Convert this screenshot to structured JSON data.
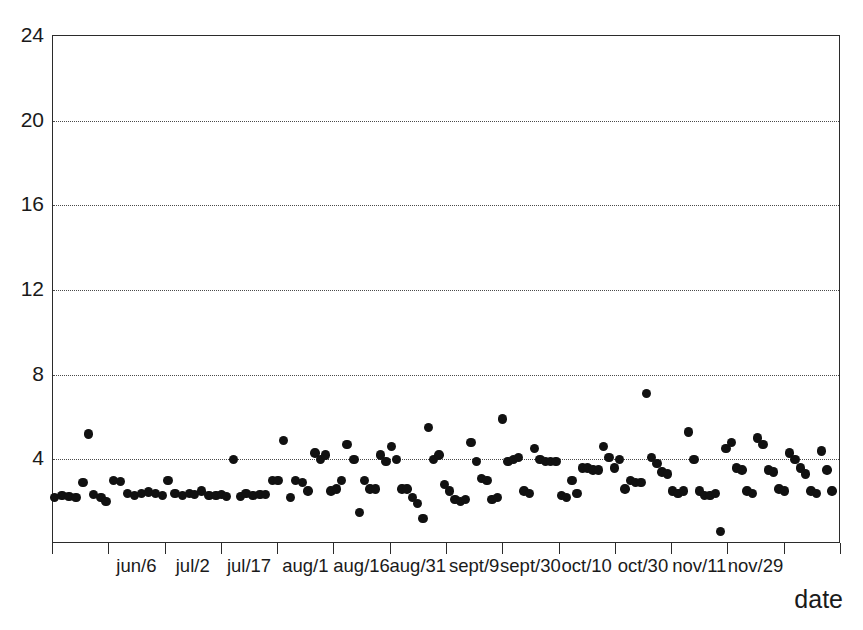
{
  "chart_data": {
    "type": "scatter",
    "title": "",
    "xlabel": "date",
    "ylabel": "",
    "ylim": [
      0,
      24
    ],
    "yticks": [
      4,
      8,
      12,
      16,
      20,
      24
    ],
    "ytick_labels": [
      "4",
      "8",
      "12",
      "16",
      "20",
      "24"
    ],
    "grid": "horizontal-dotted",
    "legend": "none",
    "xtick_labels": [
      "jun/6",
      "jul/2",
      "jul/17",
      "aug/1",
      "aug/16",
      "aug/31",
      "sept/9",
      "sept/30",
      "oct/10",
      "oct/30",
      "nov/11",
      "nov/29"
    ],
    "xtick_count": 14,
    "marker": {
      "shape": "circle",
      "color": "#111111",
      "size": 9
    },
    "points": [
      {
        "x": 2,
        "y": 2.2
      },
      {
        "x": 10,
        "y": 2.3
      },
      {
        "x": 18,
        "y": 2.25
      },
      {
        "x": 26,
        "y": 2.2
      },
      {
        "x": 34,
        "y": 2.9
      },
      {
        "x": 40,
        "y": 5.2
      },
      {
        "x": 46,
        "y": 2.35
      },
      {
        "x": 54,
        "y": 2.2
      },
      {
        "x": 60,
        "y": 2.0
      },
      {
        "x": 68,
        "y": 3.0
      },
      {
        "x": 76,
        "y": 2.95
      },
      {
        "x": 84,
        "y": 2.4
      },
      {
        "x": 92,
        "y": 2.3
      },
      {
        "x": 100,
        "y": 2.4
      },
      {
        "x": 108,
        "y": 2.45
      },
      {
        "x": 116,
        "y": 2.4
      },
      {
        "x": 124,
        "y": 2.3
      },
      {
        "x": 130,
        "y": 3.0
      },
      {
        "x": 138,
        "y": 2.4
      },
      {
        "x": 146,
        "y": 2.3
      },
      {
        "x": 154,
        "y": 2.4
      },
      {
        "x": 160,
        "y": 2.35
      },
      {
        "x": 168,
        "y": 2.5
      },
      {
        "x": 176,
        "y": 2.3
      },
      {
        "x": 184,
        "y": 2.3
      },
      {
        "x": 190,
        "y": 2.35
      },
      {
        "x": 196,
        "y": 2.25
      },
      {
        "x": 204,
        "y": 4.0
      },
      {
        "x": 212,
        "y": 2.25
      },
      {
        "x": 218,
        "y": 2.4
      },
      {
        "x": 226,
        "y": 2.3
      },
      {
        "x": 234,
        "y": 2.35
      },
      {
        "x": 240,
        "y": 2.35
      },
      {
        "x": 248,
        "y": 3.0
      },
      {
        "x": 254,
        "y": 3.0
      },
      {
        "x": 260,
        "y": 4.9
      },
      {
        "x": 268,
        "y": 2.2
      },
      {
        "x": 274,
        "y": 3.0
      },
      {
        "x": 282,
        "y": 2.9
      },
      {
        "x": 288,
        "y": 2.5
      },
      {
        "x": 296,
        "y": 4.3
      },
      {
        "x": 302,
        "y": 4.0
      },
      {
        "x": 308,
        "y": 4.2
      },
      {
        "x": 314,
        "y": 2.5
      },
      {
        "x": 320,
        "y": 2.6
      },
      {
        "x": 326,
        "y": 3.0
      },
      {
        "x": 332,
        "y": 4.7
      },
      {
        "x": 340,
        "y": 4.0
      },
      {
        "x": 346,
        "y": 1.5
      },
      {
        "x": 352,
        "y": 3.0
      },
      {
        "x": 358,
        "y": 2.6
      },
      {
        "x": 364,
        "y": 2.6
      },
      {
        "x": 370,
        "y": 4.2
      },
      {
        "x": 376,
        "y": 3.9
      },
      {
        "x": 382,
        "y": 4.6
      },
      {
        "x": 388,
        "y": 4.0
      },
      {
        "x": 394,
        "y": 2.6
      },
      {
        "x": 400,
        "y": 2.6
      },
      {
        "x": 406,
        "y": 2.2
      },
      {
        "x": 412,
        "y": 1.9
      },
      {
        "x": 418,
        "y": 1.2
      },
      {
        "x": 424,
        "y": 5.5
      },
      {
        "x": 430,
        "y": 4.0
      },
      {
        "x": 436,
        "y": 4.2
      },
      {
        "x": 442,
        "y": 2.8
      },
      {
        "x": 448,
        "y": 2.5
      },
      {
        "x": 454,
        "y": 2.1
      },
      {
        "x": 460,
        "y": 2.0
      },
      {
        "x": 466,
        "y": 2.1
      },
      {
        "x": 472,
        "y": 4.8
      },
      {
        "x": 478,
        "y": 3.9
      },
      {
        "x": 484,
        "y": 3.1
      },
      {
        "x": 490,
        "y": 3.0
      },
      {
        "x": 496,
        "y": 2.1
      },
      {
        "x": 502,
        "y": 2.2
      },
      {
        "x": 508,
        "y": 5.9
      },
      {
        "x": 514,
        "y": 3.9
      },
      {
        "x": 520,
        "y": 4.0
      },
      {
        "x": 526,
        "y": 4.1
      },
      {
        "x": 532,
        "y": 2.5
      },
      {
        "x": 538,
        "y": 2.4
      },
      {
        "x": 544,
        "y": 4.5
      },
      {
        "x": 550,
        "y": 4.0
      },
      {
        "x": 556,
        "y": 3.9
      },
      {
        "x": 562,
        "y": 3.9
      },
      {
        "x": 568,
        "y": 3.9
      },
      {
        "x": 574,
        "y": 2.3
      },
      {
        "x": 580,
        "y": 2.2
      },
      {
        "x": 586,
        "y": 3.0
      },
      {
        "x": 592,
        "y": 2.4
      },
      {
        "x": 598,
        "y": 3.6
      },
      {
        "x": 604,
        "y": 3.6
      },
      {
        "x": 610,
        "y": 3.5
      },
      {
        "x": 616,
        "y": 3.5
      },
      {
        "x": 622,
        "y": 4.6
      },
      {
        "x": 628,
        "y": 4.1
      },
      {
        "x": 634,
        "y": 3.6
      },
      {
        "x": 640,
        "y": 4.0
      },
      {
        "x": 646,
        "y": 2.6
      },
      {
        "x": 652,
        "y": 3.0
      },
      {
        "x": 658,
        "y": 2.9
      },
      {
        "x": 664,
        "y": 2.9
      },
      {
        "x": 670,
        "y": 7.1
      },
      {
        "x": 676,
        "y": 4.1
      },
      {
        "x": 682,
        "y": 3.8
      },
      {
        "x": 688,
        "y": 3.4
      },
      {
        "x": 694,
        "y": 3.3
      },
      {
        "x": 700,
        "y": 2.5
      },
      {
        "x": 706,
        "y": 2.4
      },
      {
        "x": 712,
        "y": 2.5
      },
      {
        "x": 718,
        "y": 5.3
      },
      {
        "x": 724,
        "y": 4.0
      },
      {
        "x": 730,
        "y": 2.5
      },
      {
        "x": 736,
        "y": 2.3
      },
      {
        "x": 742,
        "y": 2.3
      },
      {
        "x": 748,
        "y": 2.4
      },
      {
        "x": 754,
        "y": 0.6
      },
      {
        "x": 760,
        "y": 4.5
      },
      {
        "x": 766,
        "y": 4.8
      },
      {
        "x": 772,
        "y": 3.6
      },
      {
        "x": 778,
        "y": 3.5
      },
      {
        "x": 784,
        "y": 2.5
      },
      {
        "x": 790,
        "y": 2.4
      },
      {
        "x": 796,
        "y": 5.0
      },
      {
        "x": 802,
        "y": 4.7
      },
      {
        "x": 808,
        "y": 3.5
      },
      {
        "x": 814,
        "y": 3.4
      },
      {
        "x": 820,
        "y": 2.6
      },
      {
        "x": 826,
        "y": 2.5
      },
      {
        "x": 832,
        "y": 4.3
      },
      {
        "x": 838,
        "y": 4.0
      },
      {
        "x": 844,
        "y": 3.6
      },
      {
        "x": 850,
        "y": 3.3
      },
      {
        "x": 856,
        "y": 2.5
      },
      {
        "x": 862,
        "y": 2.4
      },
      {
        "x": 868,
        "y": 4.4
      },
      {
        "x": 874,
        "y": 3.5
      },
      {
        "x": 880,
        "y": 2.5
      }
    ]
  },
  "axes": {
    "x_title": "date"
  }
}
